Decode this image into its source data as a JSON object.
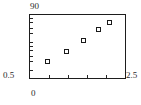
{
  "chart_data": {
    "type": "scatter",
    "title": "",
    "xlabel": "",
    "ylabel": "",
    "xlim": [
      0,
      2.5
    ],
    "ylim": [
      0.5,
      90
    ],
    "yscale": "log",
    "xscale": "linear",
    "grid": false,
    "legend": null,
    "x": [
      0.45,
      0.95,
      1.4,
      1.8,
      2.1
    ],
    "y": [
      2.0,
      4.5,
      11.0,
      28.0,
      50.0
    ],
    "points": [
      {
        "x": 0.45,
        "y": 2.0
      },
      {
        "x": 0.95,
        "y": 4.5
      },
      {
        "x": 1.4,
        "y": 11.0
      },
      {
        "x": 1.8,
        "y": 28.0
      },
      {
        "x": 2.1,
        "y": 50.0
      }
    ],
    "axis_labels": {
      "y_max": "90",
      "y_min": "0.5",
      "x_min": "0",
      "x_max": "2.5"
    },
    "xticks": [
      0.5,
      1.0,
      1.5,
      2.0
    ],
    "yticks": [
      1,
      2,
      3,
      5,
      7,
      10,
      20,
      30,
      50,
      70
    ],
    "marker": {
      "shape": "square",
      "face_color": "#ffffff",
      "edge_color": "#1a1a1a",
      "size": 5
    },
    "frame_color": "#1d1d1d",
    "background_color": "#ffffff",
    "text_color": "#2b2b2b"
  }
}
